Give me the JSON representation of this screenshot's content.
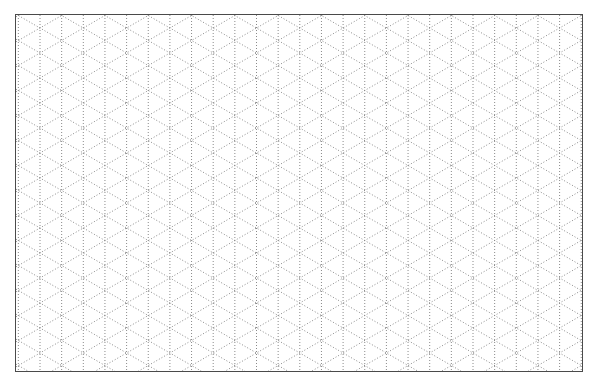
{
  "paper": {
    "type": "isometric-dot-grid",
    "line_style": "dotted",
    "line_color": "#8a8a8a",
    "border_color": "#4a4a4a",
    "background": "#ffffff",
    "vertical_spacing_px": 21.65,
    "diagonal_angle_deg": 30
  }
}
